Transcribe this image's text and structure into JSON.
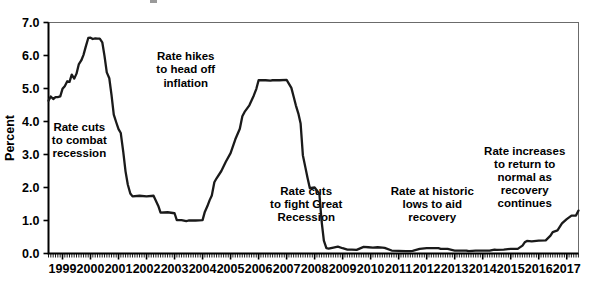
{
  "chart_data": {
    "type": "line",
    "title": "",
    "xlabel": "",
    "ylabel": "Percent",
    "ylim": [
      0.0,
      7.0
    ],
    "xlim": [
      1999.0,
      2017.92
    ],
    "yticks": [
      "0.0",
      "1.0",
      "2.0",
      "3.0",
      "4.0",
      "5.0",
      "6.0",
      "7.0"
    ],
    "ytick_values": [
      0.0,
      1.0,
      2.0,
      3.0,
      4.0,
      5.0,
      6.0,
      7.0
    ],
    "xticks": [
      "1999",
      "2000",
      "2001",
      "2002",
      "2003",
      "2004",
      "2005",
      "2006",
      "2007",
      "2008",
      "2009",
      "2010",
      "2011",
      "2012",
      "2013",
      "2014",
      "2015",
      "2016",
      "2017"
    ],
    "xtick_values": [
      1999,
      2000,
      2001,
      2002,
      2003,
      2004,
      2005,
      2006,
      2007,
      2008,
      2009,
      2010,
      2011,
      2012,
      2013,
      2014,
      2015,
      2016,
      2017
    ],
    "grid": false,
    "legend": false,
    "line_color": "#1a1a1a",
    "series": [
      {
        "name": "Federal funds rate",
        "x": [
          1999.0,
          1999.08,
          1999.17,
          1999.25,
          1999.33,
          1999.42,
          1999.5,
          1999.58,
          1999.67,
          1999.75,
          1999.83,
          1999.92,
          2000.0,
          2000.08,
          2000.17,
          2000.25,
          2000.33,
          2000.42,
          2000.5,
          2000.58,
          2000.67,
          2000.75,
          2000.83,
          2000.92,
          2001.0,
          2001.08,
          2001.17,
          2001.25,
          2001.33,
          2001.42,
          2001.5,
          2001.58,
          2001.67,
          2001.75,
          2001.83,
          2001.92,
          2002.0,
          2002.25,
          2002.5,
          2002.75,
          2002.92,
          2003.0,
          2003.25,
          2003.5,
          2003.58,
          2003.75,
          2003.92,
          2004.0,
          2004.25,
          2004.5,
          2004.58,
          2004.67,
          2004.75,
          2004.83,
          2004.92,
          2005.0,
          2005.17,
          2005.33,
          2005.5,
          2005.67,
          2005.83,
          2005.92,
          2006.0,
          2006.17,
          2006.33,
          2006.42,
          2006.5,
          2006.75,
          2006.92,
          2007.0,
          2007.25,
          2007.5,
          2007.67,
          2007.75,
          2007.83,
          2007.92,
          2008.0,
          2008.08,
          2008.17,
          2008.25,
          2008.33,
          2008.5,
          2008.67,
          2008.75,
          2008.83,
          2008.92,
          2009.0,
          2009.17,
          2009.33,
          2009.5,
          2009.67,
          2009.83,
          2010.0,
          2010.25,
          2010.42,
          2010.58,
          2010.75,
          2010.92,
          2011.0,
          2011.25,
          2011.5,
          2011.75,
          2011.92,
          2012.0,
          2012.25,
          2012.5,
          2012.75,
          2012.92,
          2013.0,
          2013.25,
          2013.5,
          2013.75,
          2013.92,
          2014.0,
          2014.25,
          2014.5,
          2014.75,
          2014.92,
          2015.0,
          2015.25,
          2015.5,
          2015.75,
          2015.92,
          2016.0,
          2016.08,
          2016.25,
          2016.5,
          2016.75,
          2016.92,
          2017.0,
          2017.17,
          2017.33,
          2017.5,
          2017.67,
          2017.83,
          2017.92
        ],
        "y": [
          4.63,
          4.76,
          4.68,
          4.74,
          4.74,
          4.76,
          4.99,
          5.07,
          5.22,
          5.2,
          5.42,
          5.3,
          5.45,
          5.73,
          5.85,
          6.02,
          6.27,
          6.53,
          6.54,
          6.5,
          6.52,
          6.51,
          6.51,
          6.4,
          5.98,
          5.49,
          5.31,
          4.8,
          4.21,
          3.97,
          3.77,
          3.65,
          3.07,
          2.49,
          2.09,
          1.82,
          1.73,
          1.75,
          1.73,
          1.75,
          1.44,
          1.24,
          1.25,
          1.22,
          1.01,
          1.01,
          0.98,
          1.0,
          1.0,
          1.01,
          1.26,
          1.43,
          1.61,
          1.76,
          2.16,
          2.28,
          2.5,
          2.78,
          3.04,
          3.46,
          3.78,
          4.16,
          4.29,
          4.49,
          4.79,
          4.99,
          5.25,
          5.25,
          5.24,
          5.25,
          5.25,
          5.26,
          5.02,
          4.76,
          4.49,
          4.24,
          3.94,
          2.98,
          2.61,
          2.28,
          1.98,
          2.0,
          1.81,
          0.97,
          0.39,
          0.16,
          0.15,
          0.18,
          0.21,
          0.16,
          0.12,
          0.12,
          0.11,
          0.2,
          0.19,
          0.18,
          0.19,
          0.18,
          0.17,
          0.09,
          0.08,
          0.07,
          0.07,
          0.08,
          0.14,
          0.16,
          0.16,
          0.16,
          0.14,
          0.14,
          0.09,
          0.09,
          0.09,
          0.07,
          0.09,
          0.09,
          0.09,
          0.12,
          0.11,
          0.12,
          0.14,
          0.14,
          0.24,
          0.34,
          0.38,
          0.37,
          0.39,
          0.4,
          0.54,
          0.65,
          0.7,
          0.91,
          1.04,
          1.15,
          1.15,
          1.3
        ]
      }
    ],
    "annotations": [
      {
        "id": "rate-cuts-recession",
        "lines": [
          "Rate cuts",
          "to combat",
          "recession"
        ],
        "x": 2000.1,
        "y": 3.72
      },
      {
        "id": "rate-hikes-inflation",
        "lines": [
          "Rate hikes",
          "to head off",
          "inflation"
        ],
        "x": 2003.9,
        "y": 5.86
      },
      {
        "id": "rate-cuts-great-recession",
        "lines": [
          "Rate cuts",
          "to fight Great",
          "Recession"
        ],
        "x": 2008.2,
        "y": 1.78
      },
      {
        "id": "rate-historic-lows",
        "lines": [
          "Rate at historic",
          "lows to aid",
          "recovery"
        ],
        "x": 2012.7,
        "y": 1.78
      },
      {
        "id": "rate-increases-normal",
        "lines": [
          "Rate increases",
          "to return to",
          "normal as",
          "recovery",
          "continues"
        ],
        "x": 2016.0,
        "y": 3.0
      }
    ]
  }
}
